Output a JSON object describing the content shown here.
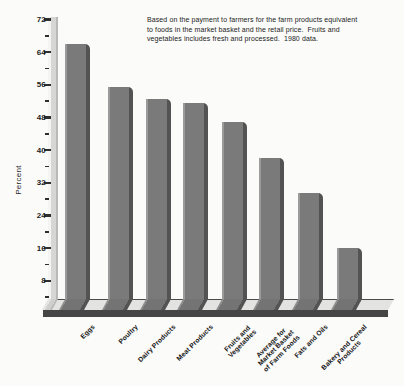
{
  "chart_data": {
    "type": "bar",
    "note_lines": [
      "Based on the payment to farmers for the farm products equivalent",
      "to foods in the market basket and the retail price.  Fruits and",
      "vegetables includes fresh and processed.  1980 data."
    ],
    "ylabel": "Percent",
    "yticks": [
      72,
      64,
      56,
      48,
      40,
      32,
      24,
      16,
      8
    ],
    "minor_yticks": [
      68,
      60,
      52,
      44,
      36,
      28,
      20,
      12,
      4
    ],
    "ylim": [
      0,
      72
    ],
    "grid": false,
    "legend_position": "none",
    "categories": [
      [
        "Eggs"
      ],
      [
        "Poultry"
      ],
      [
        "Dairy Products"
      ],
      [
        "Meat Products"
      ],
      [
        "Fruits and",
        "Vegetables"
      ],
      [
        "Average for",
        "Market Basket",
        "of Farm Foods"
      ],
      [
        "Fats and Oils"
      ],
      [
        "Bakery and Cereal",
        "Products"
      ]
    ],
    "values": [
      66,
      55.5,
      52.5,
      51.5,
      47,
      38,
      29.5,
      16
    ]
  },
  "colors": {
    "bar_face": "#7a7a7a",
    "bar_shade": "#535353",
    "bar_highlight": "#9b9b9b",
    "platform_top": "#e3e3e1",
    "platform_front": "#464646",
    "axis_column": "#d6d6d4",
    "tick": "#2e2e2e",
    "text": "#1d1d1d",
    "background": "#fbfbfa"
  }
}
